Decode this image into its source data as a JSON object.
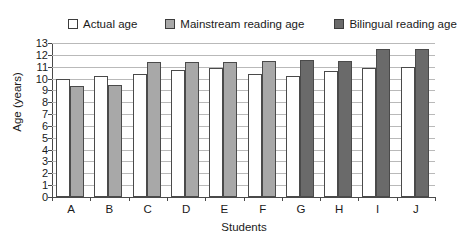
{
  "chart_data": {
    "type": "bar",
    "title": "",
    "xlabel": "Students",
    "ylabel": "Age (years)",
    "categories": [
      "A",
      "B",
      "C",
      "D",
      "E",
      "F",
      "G",
      "H",
      "I",
      "J"
    ],
    "ylim": [
      0,
      13
    ],
    "yticks": [
      0,
      1,
      2,
      3,
      4,
      5,
      6,
      7,
      8,
      9,
      10,
      11,
      12,
      13
    ],
    "ytick_labels": [
      "0",
      "1",
      "2",
      "3",
      "4",
      "5",
      "6",
      "7",
      "8",
      "9",
      "10",
      "11",
      "12",
      "13"
    ],
    "grid": true,
    "legend_position": "top",
    "series": [
      {
        "name": "Actual age",
        "color": "#ffffff",
        "values": [
          10.0,
          10.25,
          10.4,
          10.7,
          10.9,
          10.4,
          10.2,
          10.6,
          10.9,
          11.0
        ]
      },
      {
        "name": "Mainstream reading age",
        "color": "#a8a8a8",
        "values": [
          9.4,
          9.45,
          11.4,
          11.4,
          11.4,
          11.5,
          null,
          null,
          null,
          null
        ]
      },
      {
        "name": "Bilingual reading age",
        "color": "#6a6a6a",
        "values": [
          null,
          null,
          null,
          null,
          null,
          null,
          11.6,
          11.5,
          12.5,
          12.5
        ]
      }
    ]
  },
  "legend": {
    "items": [
      {
        "label": "Actual age",
        "color": "#ffffff"
      },
      {
        "label": "Mainstream reading age",
        "color": "#a8a8a8"
      },
      {
        "label": "Bilingual reading age",
        "color": "#6a6a6a"
      }
    ]
  },
  "axes": {
    "y_title": "Age (years)",
    "x_title": "Students"
  }
}
